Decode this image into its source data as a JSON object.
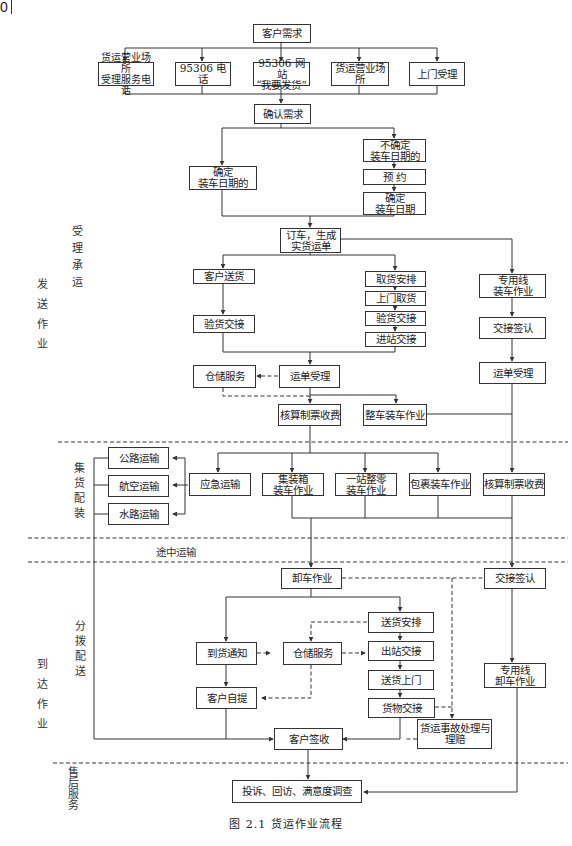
{
  "page_number": "0",
  "caption": "图 2.1   货运作业流程",
  "stage_labels": {
    "send_ops": "发送作业",
    "accept": "受理承运",
    "consolidate": "集货配装",
    "transit": "途中运输",
    "distribute": "分拨配送",
    "arrive_ops": "到达作业",
    "after_sales": "售后服务"
  },
  "nodes": {
    "customer_demand": "客户需求",
    "ch_phone_station": "货运营业场所\n受理服务电话",
    "ch_95306_phone": "95306  电话",
    "ch_95306_web": "95306 网站\n“我要发货”",
    "ch_station": "货运营业场所",
    "ch_door": "上门受理",
    "confirm_demand": "确认需求",
    "date_confirmed": "确定\n装车日期的",
    "date_unconfirmed": "不确定\n装车日期的",
    "reserve": "预      约",
    "set_date": "确定\n装车日期",
    "order_waybill": "订车，生成\n实货运单",
    "customer_delivery": "客户送货",
    "inspect_handover_1": "验货交接",
    "pickup_plan": "取货安排",
    "door_pickup": "上门取货",
    "inspect_handover_2": "验货交接",
    "station_handover": "进站交接",
    "siding_loading": "专用线\n装车作业",
    "handover_sign_1": "交接签认",
    "waybill_accept_2": "运单受理",
    "storage_1": "仓储服务",
    "waybill_accept_1": "运单受理",
    "billing_1": "核算制票收费",
    "full_car_loading": "整车装车作业",
    "road": "公路运输",
    "air": "航空运输",
    "water": "水路运输",
    "emergency": "应急运输",
    "container_loading": "集装箱\n装车作业",
    "one_stop_lcl": "一站整零\n装车作业",
    "parcel_loading": "包裹装车作业",
    "billing_2": "核算制票收费",
    "unloading": "卸车作业",
    "handover_sign_2": "交接签认",
    "delivery_plan": "送货安排",
    "arrival_notice": "到货通知",
    "storage_2": "仓储服务",
    "outbound_handover": "出站交接",
    "door_delivery": "送货上门",
    "siding_unloading": "专用线\n卸车作业",
    "self_pickup": "客户自提",
    "cargo_handover": "货物交接",
    "customer_sign": "客户签收",
    "accident_claims": "货运事故处理与\n理赔",
    "feedback": "投诉、回访、满意度调查"
  }
}
